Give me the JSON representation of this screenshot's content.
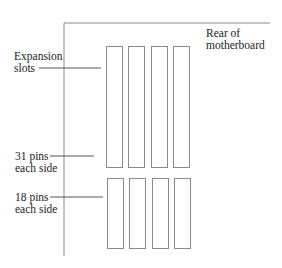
{
  "diagram": {
    "labels": {
      "rear": [
        "Rear of",
        "motherboard"
      ],
      "expansion": [
        "Expansion",
        "slots"
      ],
      "pins31": [
        "31 pins",
        "each side"
      ],
      "pins18": [
        "18 pins",
        "each side"
      ]
    },
    "slot_count_per_row": 4,
    "rows": [
      {
        "name": "top-row",
        "pins_each_side": 31
      },
      {
        "name": "bottom-row",
        "pins_each_side": 18
      }
    ],
    "colors": {
      "line": "#8a8a8a",
      "text": "#222222"
    }
  }
}
